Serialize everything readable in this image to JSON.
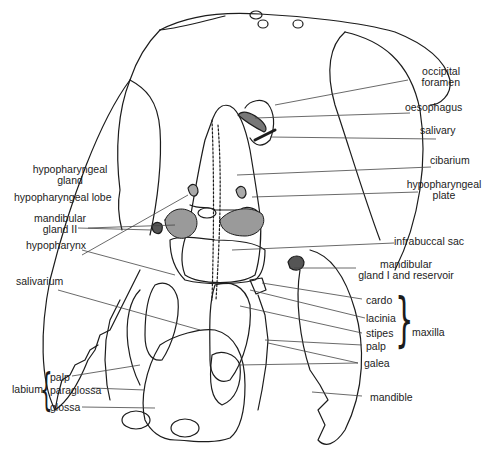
{
  "figure": {
    "colors": {
      "ink": "#1c1c1c",
      "background": "#ffffff"
    }
  },
  "labels": {
    "right": {
      "occipital_foramen": [
        "occipital",
        "foramen"
      ],
      "oesophagus": "oesophagus",
      "salivary": "salivary",
      "cibarium": "cibarium",
      "hypopharyngeal_plate": [
        "hypopharyngeal",
        "plate"
      ],
      "infrabuccal_sac": "infrabuccal sac",
      "mandibular_gland_1": [
        "mandibular",
        "gland  I  and  reservoir"
      ],
      "cardo": "cardo",
      "lacinia": "lacinia",
      "stipes": "stipes",
      "palp": "palp",
      "galea": "galea",
      "maxilla": "maxilla",
      "mandible": "mandible"
    },
    "left": {
      "hypopharyngeal_gland": [
        "hypopharyngeal",
        "gland"
      ],
      "hypopharyngeal_lobe": "hypopharyngeal  lobe",
      "mandibular_gland_2": [
        "mandibular",
        "gland  II"
      ],
      "hypopharynx": "hypopharynx",
      "salivarium": "salivarium",
      "labium": "labium",
      "labium_palp": "palp",
      "paraglossa": "paraglossa",
      "glossa": "glossa"
    }
  }
}
